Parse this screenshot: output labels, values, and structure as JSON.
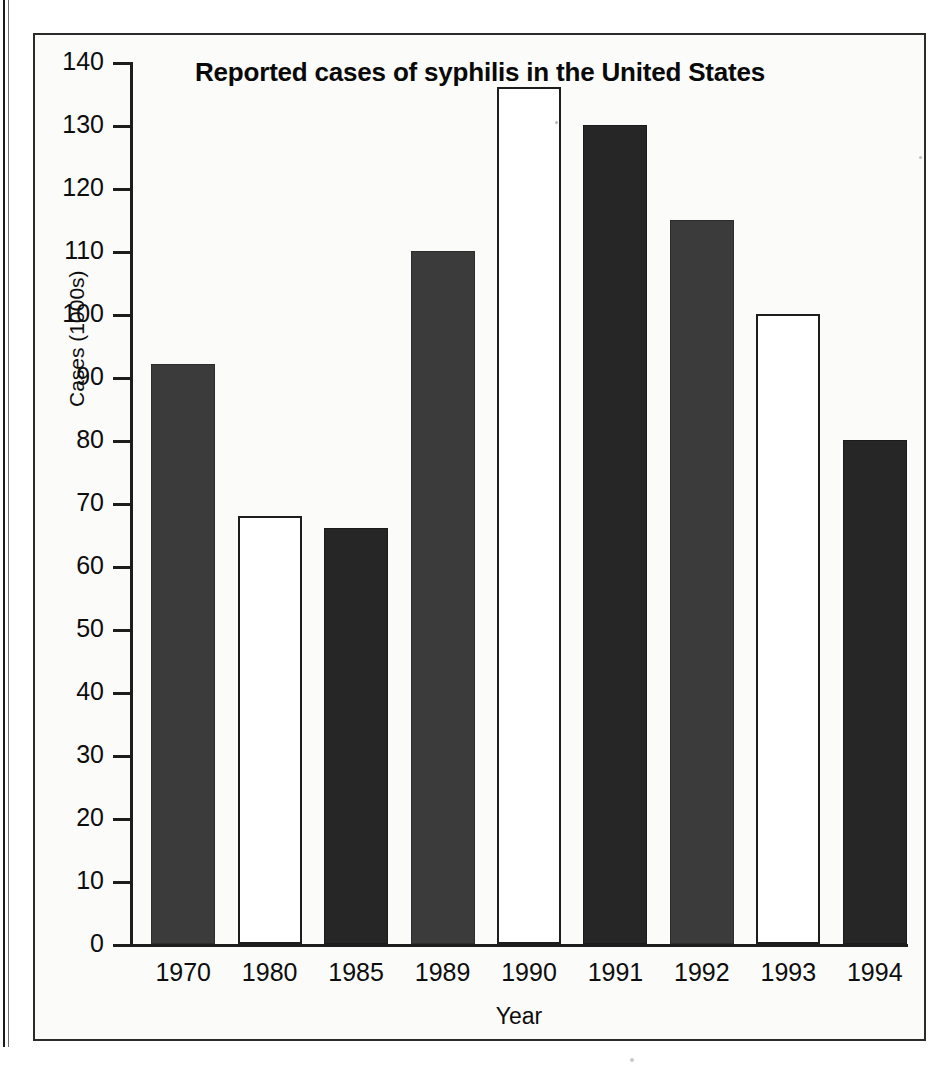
{
  "chart_data": {
    "type": "bar",
    "title": "Reported cases of syphilis in the United States",
    "xlabel": "Year",
    "ylabel": "Cases (1000s)",
    "categories": [
      "1970",
      "1980",
      "1985",
      "1989",
      "1990",
      "1991",
      "1992",
      "1993",
      "1994"
    ],
    "values": [
      92,
      68,
      66,
      110,
      136,
      130,
      115,
      100,
      80
    ],
    "bar_styles": [
      "dark",
      "white",
      "darker",
      "dark",
      "white",
      "darker",
      "dark",
      "white",
      "darker"
    ],
    "ylim": [
      0,
      140
    ],
    "yticks": [
      "0",
      "10",
      "20",
      "30",
      "40",
      "50",
      "60",
      "70",
      "80",
      "90",
      "100",
      "110",
      "120",
      "130",
      "140"
    ],
    "ytick_values": [
      0,
      10,
      20,
      30,
      40,
      50,
      60,
      70,
      80,
      90,
      100,
      110,
      120,
      130,
      140
    ],
    "grid": false,
    "legend": "none",
    "colors": {
      "bar_dark": "#3b3b3b",
      "bar_darker": "#262626",
      "bar_white": "#ffffff",
      "axis": "#1d1d1d",
      "text": "#0d0d0d",
      "background": "#fbfbfa"
    }
  }
}
